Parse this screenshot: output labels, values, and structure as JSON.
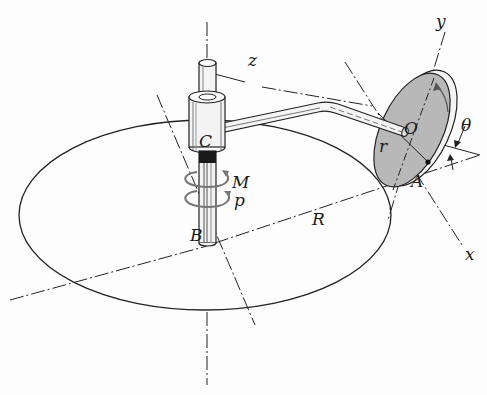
{
  "figure": {
    "colors": {
      "line": "#222222",
      "disk_fill": "#b8b8b8",
      "shaft_dark": "#1a1a1a",
      "arrow_gray": "#777777"
    }
  },
  "labels": {
    "z": "z",
    "C": "C",
    "M": "M",
    "p": "p",
    "B": "B",
    "R": "R",
    "O": "O",
    "r": "r",
    "A": "A",
    "theta": "θ",
    "y": "y",
    "x": "x"
  },
  "components": {
    "shaft": "vertical-shaft",
    "collar": "collar-C",
    "arm": "bent-arm",
    "disk": "disk-O",
    "path_circle": "horizontal-circle-R"
  }
}
